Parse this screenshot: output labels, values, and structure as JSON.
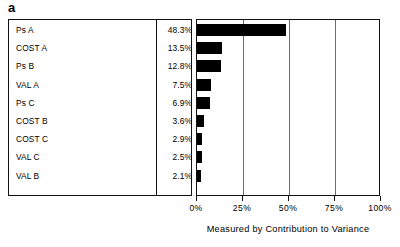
{
  "panel": {
    "letter": "a"
  },
  "chart_data": {
    "type": "bar",
    "orientation": "horizontal",
    "title": "",
    "xlabel": "Measured by Contribution to Variance",
    "ylabel": "",
    "xlim": [
      0,
      100
    ],
    "xticks": [
      "0%",
      "25%",
      "50%",
      "75%",
      "100%"
    ],
    "xtick_values": [
      0,
      25,
      50,
      75,
      100
    ],
    "grid": true,
    "legend": "none",
    "categories": [
      "Ps A",
      "COST A",
      "Ps B",
      "VAL A",
      "Ps C",
      "COST B",
      "COST C",
      "VAL C",
      "VAL B"
    ],
    "values": [
      48.3,
      13.5,
      12.8,
      7.5,
      6.9,
      3.6,
      2.9,
      2.5,
      2.1
    ],
    "value_labels": [
      "48.3%",
      "13.5%",
      "12.8%",
      "7.5%",
      "6.9%",
      "3.6%",
      "2.9%",
      "2.5%",
      "2.1%"
    ],
    "bar_color": "#000000",
    "rows": [
      {
        "label": "Ps A",
        "value": 48.3,
        "value_label": "48.3%"
      },
      {
        "label": "COST A",
        "value": 13.5,
        "value_label": "13.5%"
      },
      {
        "label": "Ps B",
        "value": 12.8,
        "value_label": "12.8%"
      },
      {
        "label": "VAL A",
        "value": 7.5,
        "value_label": "7.5%"
      },
      {
        "label": "Ps C",
        "value": 6.9,
        "value_label": "6.9%"
      },
      {
        "label": "COST B",
        "value": 3.6,
        "value_label": "3.6%"
      },
      {
        "label": "COST C",
        "value": 2.9,
        "value_label": "2.9%"
      },
      {
        "label": "VAL C",
        "value": 2.5,
        "value_label": "2.5%"
      },
      {
        "label": "VAL B",
        "value": 2.1,
        "value_label": "2.1%"
      }
    ]
  }
}
